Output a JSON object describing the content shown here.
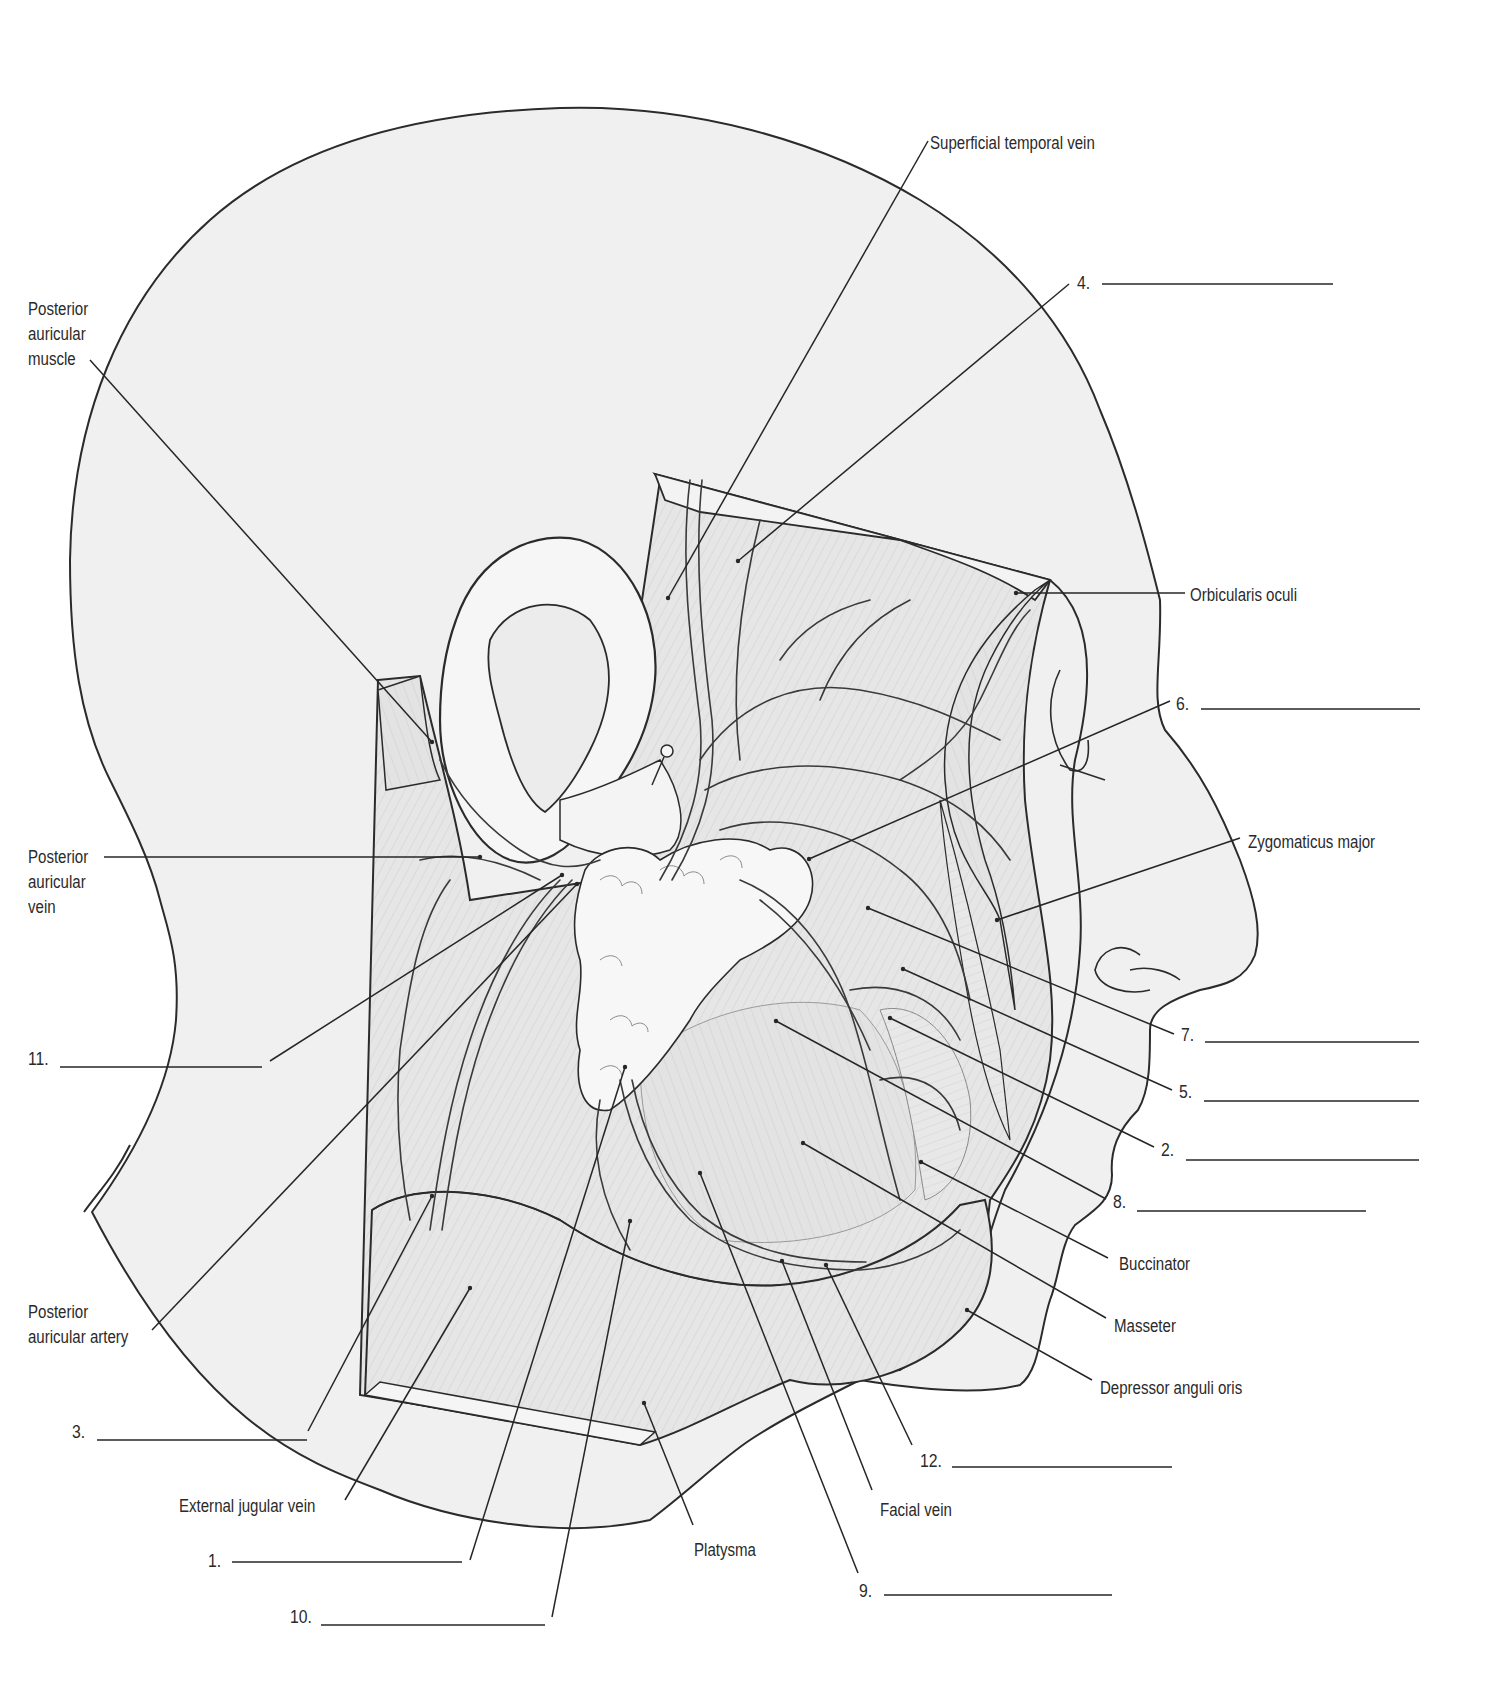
{
  "diagram": {
    "colors": {
      "outline": "#2b2b2b",
      "skin_fill": "#efefef",
      "muscle_fill": "#e4e4e4",
      "gland_fill": "#f4f4f4",
      "vessel_fill": "#f7f7f7",
      "leader": "#262626",
      "text": "#2a2a2a"
    },
    "named_labels": [
      {
        "id": "superficial-temporal-vein",
        "text": "Superficial temporal vein",
        "x": 930,
        "y": 131,
        "anchor": "start",
        "line": [
          928,
          141,
          668,
          598
        ]
      },
      {
        "id": "posterior-auricular-muscle",
        "text": "Posterior\nauricular\nmuscle",
        "x": 28,
        "y": 297,
        "anchor": "start",
        "line": [
          90,
          360,
          432,
          742
        ]
      },
      {
        "id": "orbicularis-oculi",
        "text": "Orbicularis oculi",
        "x": 1190,
        "y": 583,
        "anchor": "start",
        "line": [
          1185,
          593,
          1016,
          593
        ]
      },
      {
        "id": "zygomaticus-major",
        "text": "Zygomaticus major",
        "x": 1248,
        "y": 830,
        "anchor": "start",
        "line": [
          1240,
          838,
          997,
          920
        ]
      },
      {
        "id": "posterior-auricular-vein",
        "text": "Posterior\nauricular\nvein",
        "x": 28,
        "y": 845,
        "anchor": "start",
        "line": [
          104,
          857,
          480,
          857
        ]
      },
      {
        "id": "buccinator",
        "text": "Buccinator",
        "x": 1119,
        "y": 1252,
        "anchor": "start",
        "line": [
          1108,
          1258,
          921,
          1162
        ]
      },
      {
        "id": "masseter",
        "text": "Masseter",
        "x": 1114,
        "y": 1314,
        "anchor": "start",
        "line": [
          1106,
          1318,
          803,
          1143
        ]
      },
      {
        "id": "depressor-anguli-oris",
        "text": "Depressor anguli oris",
        "x": 1100,
        "y": 1376,
        "anchor": "start",
        "line": [
          1092,
          1380,
          967,
          1310
        ]
      },
      {
        "id": "posterior-auricular-artery",
        "text": "Posterior\nauricular artery",
        "x": 28,
        "y": 1300,
        "anchor": "start",
        "line": [
          152,
          1330,
          577,
          884
        ]
      },
      {
        "id": "external-jugular-vein",
        "text": "External jugular vein",
        "x": 179,
        "y": 1494,
        "anchor": "start",
        "line": [
          345,
          1500,
          470,
          1288
        ]
      },
      {
        "id": "platysma",
        "text": "Platysma",
        "x": 694,
        "y": 1538,
        "anchor": "start",
        "line": [
          693,
          1525,
          644,
          1403
        ]
      },
      {
        "id": "facial-vein",
        "text": "Facial vein",
        "x": 880,
        "y": 1498,
        "anchor": "start",
        "line": [
          872,
          1490,
          782,
          1261
        ]
      }
    ],
    "numbered_blanks": [
      {
        "number": "1.",
        "x": 208,
        "y": 1551,
        "blank": [
          232,
          1562,
          462,
          1562
        ],
        "line": [
          470,
          1560,
          625,
          1067
        ]
      },
      {
        "number": "2.",
        "x": 1161,
        "y": 1140,
        "blank": [
          1186,
          1160,
          1419,
          1160
        ],
        "line": [
          1154,
          1147,
          890,
          1018
        ]
      },
      {
        "number": "3.",
        "x": 72,
        "y": 1422,
        "blank": [
          97,
          1440,
          307,
          1440
        ],
        "line": [
          308,
          1431,
          432,
          1196
        ]
      },
      {
        "number": "4.",
        "x": 1077,
        "y": 273,
        "blank": [
          1102,
          284,
          1333,
          284
        ],
        "line": [
          1069,
          284,
          738,
          561
        ]
      },
      {
        "number": "5.",
        "x": 1179,
        "y": 1082,
        "blank": [
          1204,
          1101,
          1419,
          1101
        ],
        "line": [
          1172,
          1090,
          903,
          969
        ]
      },
      {
        "number": "6.",
        "x": 1176,
        "y": 694,
        "blank": [
          1201,
          709,
          1420,
          709
        ],
        "line": [
          1170,
          701,
          809,
          859
        ]
      },
      {
        "number": "7.",
        "x": 1181,
        "y": 1025,
        "blank": [
          1205,
          1042,
          1419,
          1042
        ],
        "line": [
          1174,
          1034,
          868,
          908
        ]
      },
      {
        "number": "8.",
        "x": 1113,
        "y": 1192,
        "blank": [
          1137,
          1211,
          1366,
          1211
        ],
        "line": [
          1106,
          1199,
          776,
          1021
        ]
      },
      {
        "number": "9.",
        "x": 859,
        "y": 1581,
        "blank": [
          884,
          1595,
          1112,
          1595
        ],
        "line": [
          858,
          1573,
          700,
          1173
        ]
      },
      {
        "number": "10.",
        "x": 290,
        "y": 1607,
        "blank": [
          321,
          1625,
          545,
          1625
        ],
        "line": [
          552,
          1617,
          630,
          1221
        ]
      },
      {
        "number": "11.",
        "x": 28,
        "y": 1049,
        "blank": [
          60,
          1067,
          262,
          1067
        ],
        "line": [
          270,
          1061,
          562,
          875
        ]
      },
      {
        "number": "12.",
        "x": 920,
        "y": 1451,
        "blank": [
          952,
          1467,
          1172,
          1467
        ],
        "line": [
          912,
          1445,
          826,
          1265
        ]
      }
    ]
  }
}
